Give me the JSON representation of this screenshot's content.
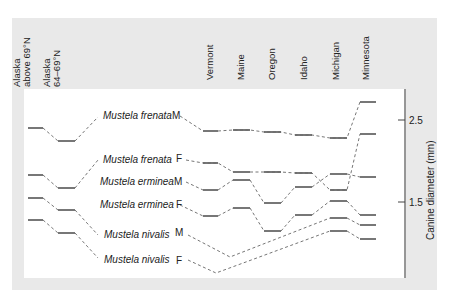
{
  "chart_data": {
    "type": "line",
    "title": "",
    "xlabel": "",
    "ylabel": "Canine diameter (mm)",
    "ylim": [
      0.6,
      2.85
    ],
    "yticks": [
      1.5,
      2.5
    ],
    "ytick_labels": [
      "1.5",
      "2.5"
    ],
    "grid": false,
    "legend": "inline labels",
    "categories": [
      "Alaska above 69°N",
      "Alaska 64–69°N",
      "Vermont",
      "Maine",
      "Oregon",
      "Idaho",
      "Michigan",
      "Minnesota"
    ],
    "series": [
      {
        "name": "Mustela frenata M",
        "values": [
          2.4,
          2.25,
          null,
          null,
          null,
          null,
          null,
          null
        ]
      },
      {
        "name": "Mustela frenata M",
        "values": [
          null,
          null,
          2.36,
          2.37,
          2.35,
          2.31,
          2.28,
          2.72
        ]
      },
      {
        "name": "Mustela frenata F",
        "values": [
          1.83,
          1.67,
          1.96,
          1.85,
          1.85,
          1.87,
          1.57,
          2.34
        ]
      },
      {
        "name": "Mustela erminea M",
        "values": [
          null,
          null,
          1.66,
          1.78,
          1.46,
          1.68,
          1.85,
          1.79
        ]
      },
      {
        "name": "Mustela erminea F",
        "values": [
          1.49,
          1.4,
          1.32,
          1.4,
          1.14,
          1.31,
          1.51,
          1.33
        ]
      },
      {
        "name": "Mustela nivalis M",
        "values": [
          1.28,
          1.12,
          null,
          0.75,
          null,
          null,
          1.3,
          1.2
        ]
      },
      {
        "name": "Mustela nivalis F",
        "values": [
          null,
          null,
          0.63,
          null,
          null,
          null,
          1.14,
          1.05
        ]
      }
    ]
  },
  "columns": {
    "labels": [
      {
        "line1": "Alaska",
        "line2": "above 69°N"
      },
      {
        "line1": "Alaska",
        "line2": "64–69°N"
      },
      {
        "line1": "Vermont",
        "line2": ""
      },
      {
        "line1": "Maine",
        "line2": ""
      },
      {
        "line1": "Oregon",
        "line2": ""
      },
      {
        "line1": "Idaho",
        "line2": ""
      },
      {
        "line1": "Michigan",
        "line2": ""
      },
      {
        "line1": "Minnesota",
        "line2": ""
      }
    ]
  },
  "labels": {
    "frenata_m": {
      "species": "Mustela frenata",
      "sex": "M"
    },
    "frenata_f": {
      "species": "Mustela frenata",
      "sex": "F"
    },
    "erminea_m": {
      "species": "Mustela erminea",
      "sex": "M"
    },
    "erminea_f": {
      "species": "Mustela erminea",
      "sex": "F"
    },
    "nivalis_m": {
      "species": "Mustela nivalis",
      "sex": "M"
    },
    "nivalis_f": {
      "species": "Mustela nivalis",
      "sex": "F"
    }
  },
  "axis": {
    "title": "Canine diameter (mm)",
    "tick_hi": "2.5",
    "tick_lo": "1.5"
  },
  "colors": {
    "panel": "#e9e9e9",
    "plot": "#ffffff",
    "line": "#555555",
    "text": "#222222"
  }
}
